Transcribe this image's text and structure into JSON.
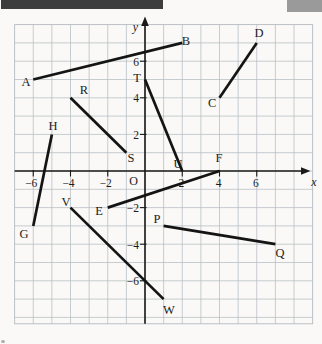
{
  "page": {
    "background": "#faf9f7"
  },
  "artifacts": {
    "top_bar_color": "#3d3d3d",
    "corner_block_color": "#9a9a9a",
    "bottom_dot_color": "#b0b0b0"
  },
  "chart_data": {
    "type": "line",
    "title": "",
    "xlabel": "x",
    "ylabel": "y",
    "origin_label": "O",
    "x_range": [
      -7,
      9
    ],
    "y_range": [
      -8.35,
      8
    ],
    "grid": true,
    "legend": "none",
    "x_ticks": [
      {
        "v": -6,
        "label": "−6"
      },
      {
        "v": -4,
        "label": "−4"
      },
      {
        "v": -2,
        "label": "−2"
      },
      {
        "v": 2,
        "label": "2"
      },
      {
        "v": 4,
        "label": "4"
      },
      {
        "v": 6,
        "label": "6"
      }
    ],
    "y_ticks": [
      {
        "v": 6,
        "label": "6"
      },
      {
        "v": 4,
        "label": "4"
      },
      {
        "v": 2,
        "label": "2"
      },
      {
        "v": -2,
        "label": "−2"
      },
      {
        "v": -4,
        "label": "−4"
      },
      {
        "v": -6,
        "label": "−6"
      }
    ],
    "segments": [
      {
        "name": "AB",
        "points": [
          [
            -6,
            5
          ],
          [
            2,
            7
          ]
        ],
        "labels": [
          {
            "text": "A",
            "x": -6.39,
            "y": 4.86
          },
          {
            "text": "B",
            "x": 2.2,
            "y": 7.1
          }
        ]
      },
      {
        "name": "CD",
        "points": [
          [
            4,
            4
          ],
          [
            6,
            7
          ]
        ],
        "labels": [
          {
            "text": "C",
            "x": 3.6,
            "y": 3.72
          },
          {
            "text": "D",
            "x": 6.12,
            "y": 7.54
          }
        ]
      },
      {
        "name": "RS",
        "points": [
          [
            -4,
            4
          ],
          [
            -1,
            1
          ]
        ],
        "labels": [
          {
            "text": "R",
            "x": -3.28,
            "y": 4.43
          },
          {
            "text": "S",
            "x": -0.75,
            "y": 0.71
          }
        ]
      },
      {
        "name": "TU",
        "points": [
          [
            0,
            5
          ],
          [
            2,
            0
          ]
        ],
        "labels": [
          {
            "text": "T",
            "x": -0.43,
            "y": 5.08
          },
          {
            "text": "U",
            "x": 1.77,
            "y": 0.38
          }
        ]
      },
      {
        "name": "EF",
        "points": [
          [
            -2,
            -2
          ],
          [
            4,
            0
          ]
        ],
        "labels": [
          {
            "text": "E",
            "x": -2.47,
            "y": -2.19
          },
          {
            "text": "F",
            "x": 3.97,
            "y": 0.71
          }
        ]
      },
      {
        "name": "HG",
        "points": [
          [
            -5,
            2
          ],
          [
            -6,
            -3
          ]
        ],
        "labels": [
          {
            "text": "H",
            "x": -4.94,
            "y": 2.46
          },
          {
            "text": "G",
            "x": -6.5,
            "y": -3.44
          }
        ]
      },
      {
        "name": "VW",
        "points": [
          [
            -4,
            -2
          ],
          [
            1,
            -7
          ]
        ],
        "labels": [
          {
            "text": "V",
            "x": -4.24,
            "y": -1.69
          },
          {
            "text": "W",
            "x": 1.29,
            "y": -7.6
          }
        ]
      },
      {
        "name": "PQ",
        "points": [
          [
            1,
            -3
          ],
          [
            7,
            -4
          ]
        ],
        "labels": [
          {
            "text": "P",
            "x": 0.64,
            "y": -2.62
          },
          {
            "text": "Q",
            "x": 7.25,
            "y": -4.48
          }
        ]
      }
    ],
    "colors": {
      "grid": "#b6bcc2",
      "axis": "#1a1a1a",
      "segment": "#141414",
      "text": "#1c1c1c"
    }
  }
}
